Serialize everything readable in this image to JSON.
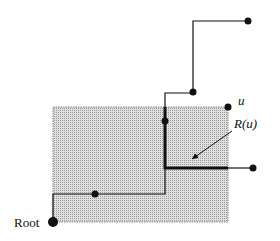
{
  "diagram": {
    "labels": {
      "root": "Root",
      "u": "u",
      "region": "R(u)"
    },
    "colors": {
      "ink": "#111111",
      "shade": "#d4d4d4",
      "background": "#ffffff"
    },
    "region_rect": {
      "x": 53,
      "y": 107,
      "w": 175,
      "h": 115
    },
    "nodes": [
      {
        "id": "root",
        "x": 53,
        "y": 222,
        "r": 5
      },
      {
        "id": "n1",
        "x": 95,
        "y": 194,
        "r": 4
      },
      {
        "id": "n2",
        "x": 165,
        "y": 121,
        "r": 4
      },
      {
        "id": "n3",
        "x": 193,
        "y": 92,
        "r": 4
      },
      {
        "id": "n4",
        "x": 248,
        "y": 21,
        "r": 4
      },
      {
        "id": "u",
        "x": 228,
        "y": 107,
        "r": 4
      },
      {
        "id": "n5",
        "x": 253,
        "y": 168,
        "r": 4
      }
    ]
  }
}
